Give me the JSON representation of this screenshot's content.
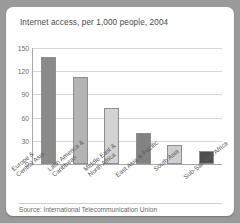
{
  "card": {
    "title": "Internet access, per 1,000 people, 2004",
    "source": "Source: International Telecommunication Union"
  },
  "chart_data": {
    "type": "bar",
    "title": "Internet access, per 1,000 people, 2004",
    "xlabel": "",
    "ylabel": "",
    "ylim": [
      0,
      150
    ],
    "yticks": [
      0,
      30,
      60,
      90,
      120,
      150
    ],
    "grid": true,
    "legend": false,
    "categories": [
      "Europe &\nCentral Asia",
      "Latin America &\nCaribbean",
      "Middle East &\nNorth Africa",
      "East Asia & Pacific",
      "South Asia",
      "Sub-Saharan Africa"
    ],
    "values": [
      138,
      113,
      72,
      40,
      24,
      17
    ],
    "bar_colors": [
      "#8a8a8a",
      "#b4b4b4",
      "#d2d2d2",
      "#828282",
      "#cfcfcf",
      "#4f4f4f"
    ],
    "source": "Source: International Telecommunication Union"
  },
  "colors": {
    "page_background": "#9a9a9a",
    "card_background": "#ffffff",
    "gridline": "#d8d8d8",
    "axis": "#a8a8a8",
    "title_text": "#4a4a4a",
    "tick_text": "#6e6e6e"
  }
}
